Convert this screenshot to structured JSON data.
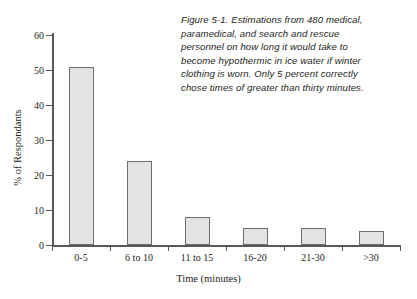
{
  "chart_data": {
    "type": "bar",
    "title": "",
    "categories": [
      "0-5",
      "6 to 10",
      "11 to 15",
      "16-20",
      "21-30",
      ">30"
    ],
    "values": [
      51,
      24,
      8,
      5,
      5,
      4
    ],
    "xlabel": "Time (minutes)",
    "ylabel": "% of Respondants",
    "ylim": [
      0,
      60
    ],
    "ytick_values": [
      0,
      10,
      20,
      30,
      40,
      50,
      60
    ],
    "ytick_labels": [
      "0",
      "10",
      "20",
      "30",
      "40",
      "50",
      "60"
    ],
    "grid": false,
    "legend": null,
    "bar_fill_color": "#e3e3e3",
    "bar_border_color": "#6d6e71",
    "axis_color": "#58595b",
    "background_color": "#ffffff",
    "annotation": {
      "lines": [
        "Figure 5-1. Estimations from 480 medical,",
        "paramedical, and search and rescue",
        "personnel on how long it would take to",
        "become hypothermic in ice water if winter",
        "clothing is worn. Only 5 percent correctly",
        "chose times of greater than thirty minutes."
      ],
      "position": "top-right",
      "style": "italic"
    }
  }
}
